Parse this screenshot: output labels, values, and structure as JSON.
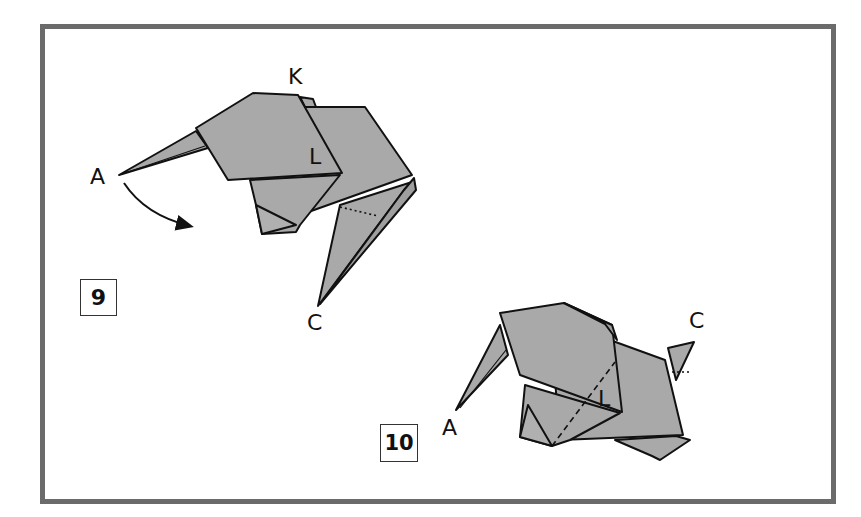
{
  "diagram": {
    "type": "origami-instructions",
    "colors": {
      "paper": "#a9a9a9",
      "outline": "#111111",
      "frame": "#6b6b6b",
      "background": "#ffffff"
    },
    "steps": [
      {
        "number": "9",
        "labels": {
          "a": "A",
          "k": "K",
          "l": "L",
          "c": "C"
        },
        "annotations": [
          "curved arrow from point A indicating fold downward"
        ]
      },
      {
        "number": "10",
        "labels": {
          "a": "A",
          "l": "L",
          "c": "C"
        },
        "annotations": [
          "dashed crease line through L",
          "dotted crease near C"
        ]
      }
    ]
  }
}
